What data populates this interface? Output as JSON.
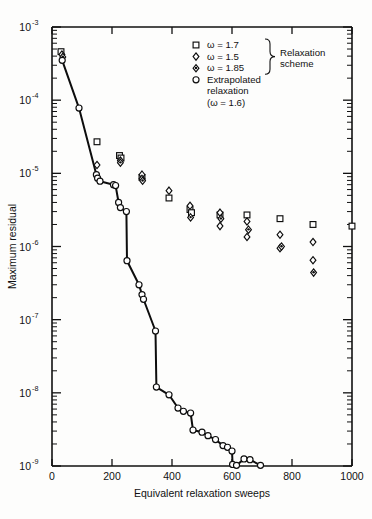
{
  "figure": {
    "background_color": "#fdfdfc",
    "ink_color": "#0d0d0d"
  },
  "chart_data": {
    "type": "scatter",
    "title": "",
    "xlabel": "Equivalent relaxation sweeps",
    "ylabel": "Maximum residual",
    "xlim": [
      0,
      1000
    ],
    "ylim": [
      1e-09,
      0.001
    ],
    "yscale": "log",
    "xscale": "linear",
    "grid": false,
    "legend_position": "top-right",
    "xticks": [
      0,
      200,
      400,
      600,
      800,
      1000
    ],
    "xtick_labels": [
      "0",
      "200",
      "400",
      "600",
      "800",
      "1000"
    ],
    "yticks": [
      0.001,
      0.0001,
      1e-05,
      1e-06,
      1e-07,
      1e-08,
      1e-09
    ],
    "ytick_labels": [
      "10-3",
      "10-4",
      "10-5",
      "10-6",
      "10-7",
      "10-8",
      "10-9"
    ],
    "ytick_mantissa": "10",
    "ytick_exponents": [
      "-3",
      "-4",
      "-5",
      "-6",
      "-7",
      "-8",
      "-9"
    ],
    "series": [
      {
        "name": "omega = 1.7",
        "marker": "square",
        "connected": false,
        "points": [
          [
            30,
            0.00046
          ],
          [
            150,
            2.7e-05
          ],
          [
            225,
            1.75e-05
          ],
          [
            230,
            1.62e-05
          ],
          [
            300,
            8.8e-06
          ],
          [
            390,
            4.6e-06
          ],
          [
            460,
            3.2e-06
          ],
          [
            465,
            2.9e-06
          ],
          [
            560,
            2.7e-06
          ],
          [
            650,
            2.7e-06
          ],
          [
            760,
            2.4e-06
          ],
          [
            870,
            2e-06
          ],
          [
            1000,
            1.9e-06
          ]
        ]
      },
      {
        "name": "omega = 1.5",
        "marker": "diamond",
        "connected": false,
        "points": [
          [
            33,
            0.00042
          ],
          [
            150,
            1.3e-05
          ],
          [
            228,
            1.5e-05
          ],
          [
            300,
            9.6e-06
          ],
          [
            300,
            8.4e-06
          ],
          [
            390,
            5.8e-06
          ],
          [
            460,
            3.6e-06
          ],
          [
            560,
            2.9e-06
          ],
          [
            560,
            1.9e-06
          ],
          [
            650,
            2.2e-06
          ],
          [
            650,
            1.35e-06
          ],
          [
            760,
            1.45e-06
          ],
          [
            760,
            9.5e-07
          ],
          [
            870,
            1.15e-06
          ],
          [
            870,
            6.5e-07
          ]
        ]
      },
      {
        "name": "omega = 1.85",
        "marker": "diamond-filled-dot",
        "connected": false,
        "points": [
          [
            36,
            0.00039
          ],
          [
            228,
            1.4e-05
          ],
          [
            302,
            7.9e-06
          ],
          [
            462,
            2.5e-06
          ],
          [
            563,
            2.4e-06
          ],
          [
            655,
            1.7e-06
          ],
          [
            765,
            1e-06
          ],
          [
            872,
            4.4e-07
          ]
        ]
      },
      {
        "name": "Extrapolated relaxation (omega = 1.6)",
        "marker": "circle",
        "connected": true,
        "points": [
          [
            34,
            0.00035
          ],
          [
            90,
            7.8e-05
          ],
          [
            148,
            9.6e-06
          ],
          [
            152,
            8.6e-06
          ],
          [
            160,
            7.8e-06
          ],
          [
            205,
            7e-06
          ],
          [
            212,
            6.8e-06
          ],
          [
            222,
            4e-06
          ],
          [
            228,
            3.4e-06
          ],
          [
            248,
            3e-06
          ],
          [
            250,
            6.4e-07
          ],
          [
            290,
            3e-07
          ],
          [
            300,
            2.2e-07
          ],
          [
            305,
            1.9e-07
          ],
          [
            345,
            7e-08
          ],
          [
            348,
            1.2e-08
          ],
          [
            390,
            9.4e-09
          ],
          [
            420,
            6.2e-09
          ],
          [
            438,
            5.6e-09
          ],
          [
            462,
            5.3e-09
          ],
          [
            470,
            3.1e-09
          ],
          [
            500,
            2.9e-09
          ],
          [
            520,
            2.6e-09
          ],
          [
            545,
            2.3e-09
          ],
          [
            570,
            1.9e-09
          ],
          [
            585,
            1.8e-09
          ],
          [
            600,
            1.6e-09
          ],
          [
            602,
            1.05e-09
          ],
          [
            615,
            1.02e-09
          ],
          [
            640,
            1.25e-09
          ],
          [
            660,
            1.22e-09
          ],
          [
            695,
            1.02e-09
          ]
        ]
      }
    ],
    "legend": {
      "entries": [
        {
          "marker": "square",
          "label": "ω = 1.7"
        },
        {
          "marker": "diamond",
          "label": "ω = 1.5"
        },
        {
          "marker": "diamond-filled-dot",
          "label": "ω = 1.85"
        },
        {
          "marker": "circle",
          "label": "Extrapolated"
        }
      ],
      "group_label_line1": "Relaxation",
      "group_label_line2": "scheme",
      "extrapolated_line2": "relaxation",
      "extrapolated_line3": "(ω = 1.6)"
    }
  }
}
